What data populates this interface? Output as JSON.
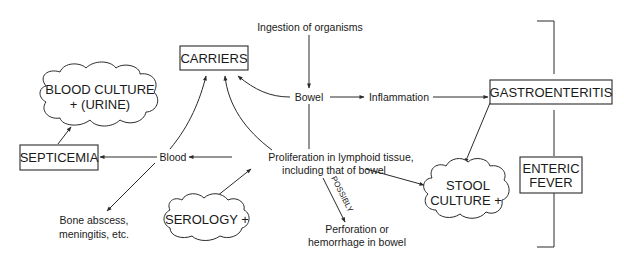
{
  "diagram": {
    "type": "flowchart",
    "nodes": {
      "ingestion": "Ingestion of organisms",
      "bowel": "Bowel",
      "inflammation": "Inflammation",
      "gastroenteritis": "GASTROENTERITIS",
      "carriers": "CARRIERS",
      "blood_culture_line1": "BLOOD CULTURE",
      "blood_culture_line2": "+ (URINE)",
      "septicemia": "SEPTICEMIA",
      "blood": "Blood",
      "proliferation_line1": "Proliferation in lymphoid tissue,",
      "proliferation_line2": "including that of bowel",
      "serology": "SEROLOGY +",
      "bone_line1": "Bone abscess,",
      "bone_line2": "meningitis, etc.",
      "possibly": "POSSIBLY",
      "perforation_line1": "Perforation or",
      "perforation_line2": "hemorrhage in bowel",
      "stool_line1": "STOOL",
      "stool_line2": "CULTURE +",
      "enteric_line1": "ENTERIC",
      "enteric_line2": "FEVER"
    },
    "edges": [
      {
        "from": "Ingestion of organisms",
        "to": "Bowel"
      },
      {
        "from": "Bowel",
        "to": "Inflammation"
      },
      {
        "from": "Inflammation",
        "to": "GASTROENTERITIS"
      },
      {
        "from": "Bowel",
        "to": "CARRIERS"
      },
      {
        "from": "Bowel",
        "to": "Proliferation in lymphoid tissue"
      },
      {
        "from": "Proliferation in lymphoid tissue",
        "to": "CARRIERS"
      },
      {
        "from": "Proliferation in lymphoid tissue",
        "to": "Blood"
      },
      {
        "from": "Proliferation in lymphoid tissue",
        "to": "STOOL CULTURE +"
      },
      {
        "from": "Proliferation in lymphoid tissue",
        "to": "Perforation or hemorrhage in bowel",
        "label": "POSSIBLY"
      },
      {
        "from": "Blood",
        "to": "CARRIERS"
      },
      {
        "from": "Blood",
        "to": "SEPTICEMIA"
      },
      {
        "from": "Blood",
        "to": "Bone abscess, meningitis, etc."
      },
      {
        "from": "SEPTICEMIA",
        "to": "BLOOD CULTURE + (URINE)"
      },
      {
        "from": "SEROLOGY +",
        "to": "Proliferation in lymphoid tissue"
      },
      {
        "from": "GASTROENTERITIS",
        "to": "STOOL CULTURE +"
      }
    ],
    "bracket_label": "ENTERIC FEVER"
  }
}
